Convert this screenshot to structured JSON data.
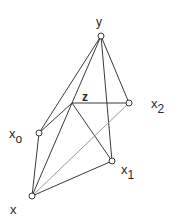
{
  "diagram": {
    "type": "graph",
    "nodes": [
      {
        "id": "y",
        "label": "y",
        "sub": "",
        "x": 101,
        "y": 36,
        "marker": true,
        "lx": 99,
        "ly": 24
      },
      {
        "id": "z",
        "label": "z",
        "sub": "",
        "x": 72,
        "y": 103,
        "marker": false,
        "lx": 83,
        "ly": 100
      },
      {
        "id": "x2",
        "label": "x",
        "sub": "2",
        "x": 129,
        "y": 103,
        "marker": true,
        "lx": 152,
        "ly": 106
      },
      {
        "id": "x0",
        "label": "x",
        "sub": "o",
        "x": 39,
        "y": 133,
        "marker": true,
        "lx": 10,
        "ly": 136
      },
      {
        "id": "x1",
        "label": "x",
        "sub": "1",
        "x": 112,
        "y": 161,
        "marker": true,
        "lx": 122,
        "ly": 172
      },
      {
        "id": "x",
        "label": "x",
        "sub": "",
        "x": 32,
        "y": 196,
        "marker": true,
        "lx": 10,
        "ly": 212
      }
    ],
    "edges": [
      {
        "from": "y",
        "to": "x2",
        "style": "solid"
      },
      {
        "from": "y",
        "to": "x1",
        "style": "solid"
      },
      {
        "from": "y",
        "to": "z",
        "style": "solid"
      },
      {
        "from": "y",
        "to": "x0",
        "style": "solid"
      },
      {
        "from": "z",
        "to": "x2",
        "style": "solid"
      },
      {
        "from": "z",
        "to": "x0",
        "style": "solid"
      },
      {
        "from": "z",
        "to": "x1",
        "style": "solid"
      },
      {
        "from": "z",
        "to": "x",
        "style": "solid"
      },
      {
        "from": "x2",
        "to": "x",
        "style": "light"
      },
      {
        "from": "x0",
        "to": "x",
        "style": "solid"
      },
      {
        "from": "x1",
        "to": "x",
        "style": "solid"
      }
    ]
  },
  "labels": {
    "y": "y",
    "z": "z",
    "x2_main": "x",
    "x2_sub": "2",
    "x0_main": "x",
    "x0_sub": "o",
    "x1_main": "x",
    "x1_sub": "1",
    "x": "x"
  }
}
